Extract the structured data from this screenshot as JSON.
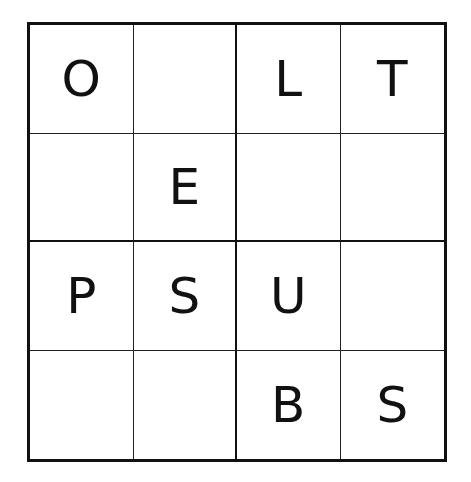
{
  "puzzle": {
    "size": 4,
    "grid": [
      [
        "O",
        "",
        "L",
        "T"
      ],
      [
        "",
        "E",
        "",
        ""
      ],
      [
        "P",
        "S",
        "U",
        ""
      ],
      [
        "",
        "",
        "B",
        "S"
      ]
    ]
  }
}
